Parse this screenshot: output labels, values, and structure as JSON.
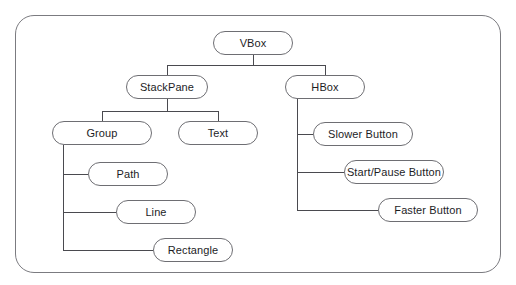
{
  "diagram": {
    "frame": {
      "label": "diagram-border"
    },
    "colors": {
      "background": "#ffffff",
      "node_stroke": "#6e6e73",
      "frame_stroke": "#7b7b80",
      "edge_stroke": "#4a4a4f",
      "text": "#1d1d1f"
    },
    "nodes": [
      {
        "id": "vbox",
        "label": "VBox",
        "x": 213,
        "y": 31,
        "w": 80,
        "h": 24
      },
      {
        "id": "stackpane",
        "label": "StackPane",
        "x": 126,
        "y": 75,
        "w": 82,
        "h": 24
      },
      {
        "id": "hbox",
        "label": "HBox",
        "x": 285,
        "y": 75,
        "w": 80,
        "h": 24
      },
      {
        "id": "group",
        "label": "Group",
        "x": 52,
        "y": 121,
        "w": 100,
        "h": 24
      },
      {
        "id": "text",
        "label": "Text",
        "x": 178,
        "y": 121,
        "w": 80,
        "h": 24
      },
      {
        "id": "path",
        "label": "Path",
        "x": 88,
        "y": 162,
        "w": 80,
        "h": 24
      },
      {
        "id": "line",
        "label": "Line",
        "x": 116,
        "y": 200,
        "w": 80,
        "h": 24
      },
      {
        "id": "rectangle",
        "label": "Rectangle",
        "x": 153,
        "y": 238,
        "w": 80,
        "h": 24
      },
      {
        "id": "slower",
        "label": "Slower Button",
        "x": 313,
        "y": 122,
        "w": 100,
        "h": 24
      },
      {
        "id": "startpause",
        "label": "Start/Pause Button",
        "x": 344,
        "y": 160,
        "w": 100,
        "h": 24
      },
      {
        "id": "faster",
        "label": "Faster Button",
        "x": 378,
        "y": 198,
        "w": 100,
        "h": 24
      }
    ],
    "edges": [
      {
        "from": "vbox",
        "to": "stackpane",
        "style": "elbow-down"
      },
      {
        "from": "vbox",
        "to": "hbox",
        "style": "elbow-down"
      },
      {
        "from": "stackpane",
        "to": "group",
        "style": "elbow-down"
      },
      {
        "from": "stackpane",
        "to": "text",
        "style": "elbow-down"
      },
      {
        "from": "group",
        "to": "path",
        "style": "elbow-side"
      },
      {
        "from": "group",
        "to": "line",
        "style": "elbow-side"
      },
      {
        "from": "group",
        "to": "rectangle",
        "style": "elbow-side"
      },
      {
        "from": "hbox",
        "to": "slower",
        "style": "elbow-side"
      },
      {
        "from": "hbox",
        "to": "startpause",
        "style": "elbow-side"
      },
      {
        "from": "hbox",
        "to": "faster",
        "style": "elbow-side"
      }
    ]
  }
}
